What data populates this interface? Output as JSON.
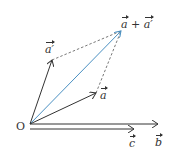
{
  "diagram": {
    "colors": {
      "vector": "#333333",
      "sum_vector": "#4a90c2",
      "dashed": "#555555"
    },
    "origin": {
      "label": "O",
      "x": 30,
      "y": 124
    },
    "vectors": [
      {
        "id": "a",
        "label": "a",
        "from": [
          30,
          124
        ],
        "to": [
          96,
          93
        ]
      },
      {
        "id": "a_prime",
        "label": "a′",
        "from": [
          30,
          124
        ],
        "to": [
          52,
          60
        ]
      },
      {
        "id": "a_plus_a_prime",
        "label_a": "a",
        "label_plus": "+",
        "label_b": "a′",
        "from": [
          30,
          124
        ],
        "to": [
          121,
          31
        ]
      },
      {
        "id": "b",
        "label": "b",
        "from": [
          30,
          124
        ],
        "to": [
          158,
          124
        ]
      },
      {
        "id": "c",
        "label": "c",
        "from": [
          30,
          129
        ],
        "to": [
          134,
          129
        ]
      }
    ],
    "dashed_lines": [
      {
        "from": [
          52,
          60
        ],
        "to": [
          121,
          31
        ]
      },
      {
        "from": [
          96,
          93
        ],
        "to": [
          121,
          31
        ]
      }
    ]
  }
}
